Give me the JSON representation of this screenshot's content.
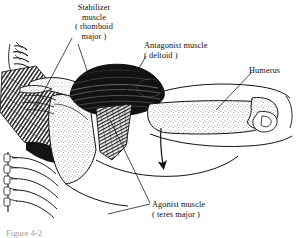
{
  "figure": {
    "domain_kind": "anatomical-illustration",
    "background_color": "#ffffff",
    "ink_color": "#000000",
    "width": 303,
    "height": 238
  },
  "labels": {
    "stabilizer": {
      "name": "stabilizer-muscle-label",
      "lines": [
        "Stabilizer",
        "muscle",
        "( rhomboid",
        "major )"
      ]
    },
    "antagonist": {
      "name": "antagonist-muscle-label",
      "lines": [
        "Antagonist muscle",
        "( deltoid )"
      ]
    },
    "humerus": {
      "name": "humerus-label",
      "lines": [
        "Humerus"
      ]
    },
    "agonist": {
      "name": "agonist-muscle-label",
      "lines": [
        "Agonist muscle",
        "( teres major )"
      ]
    }
  },
  "caption": {
    "text": "Figure 4-2",
    "clipped": true
  },
  "annotations": {
    "movement_arrow": {
      "name": "movement-direction-arrow",
      "description": "curved arrow pointing downward indicating arm adduction"
    }
  },
  "anatomy_parts": [
    {
      "name": "vertebral-column",
      "style": "outline"
    },
    {
      "name": "rib-cage",
      "style": "outline"
    },
    {
      "name": "scapula",
      "style": "stippled"
    },
    {
      "name": "clavicle",
      "style": "stippled"
    },
    {
      "name": "humerus-bone",
      "style": "stippled"
    },
    {
      "name": "deltoid-muscle",
      "style": "dark-striated"
    },
    {
      "name": "rhomboid-major-muscle",
      "style": "hatched"
    },
    {
      "name": "teres-major-muscle",
      "style": "striated-band"
    },
    {
      "name": "torso-contour",
      "style": "outline"
    }
  ]
}
